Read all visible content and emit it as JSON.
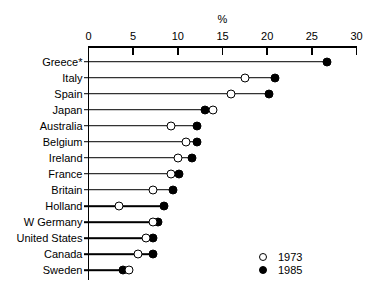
{
  "chart_data": {
    "type": "scatter",
    "title": "",
    "subtitle": "",
    "xlabel": "%",
    "ylabel": "",
    "xlim": [
      0,
      30
    ],
    "grid": false,
    "legend_position": "bottom-right",
    "xticks": [
      0,
      5,
      10,
      15,
      20,
      25,
      30
    ],
    "xtick_labels": [
      "0",
      "5",
      "10",
      "15",
      "20",
      "25",
      "30"
    ],
    "categories": [
      "Greece*",
      "Italy",
      "Spain",
      "Japan",
      "Australia",
      "Belgium",
      "Ireland",
      "France",
      "Britain",
      "Holland",
      "W Germany",
      "United States",
      "Canada",
      "Sweden"
    ],
    "series": [
      {
        "name": "1973",
        "marker": "open-circle",
        "color": "#ffffff",
        "edge_color": "#000000",
        "values": [
          null,
          17.5,
          16.0,
          13.9,
          9.2,
          10.9,
          10.0,
          9.2,
          7.2,
          3.4,
          7.2,
          6.4,
          5.5,
          4.5
        ]
      },
      {
        "name": "1985",
        "marker": "filled-circle",
        "color": "#000000",
        "edge_color": "#000000",
        "values": [
          26.7,
          20.9,
          20.2,
          13.0,
          12.2,
          12.1,
          11.6,
          10.1,
          9.5,
          8.5,
          7.8,
          7.2,
          7.2,
          3.9
        ]
      }
    ],
    "legend": [
      {
        "label": "1973",
        "marker": "open-circle"
      },
      {
        "label": "1985",
        "marker": "filled-circle"
      }
    ],
    "annotations": [
      {
        "text": "*",
        "note": "asterisk appended to Greece category label"
      }
    ]
  }
}
